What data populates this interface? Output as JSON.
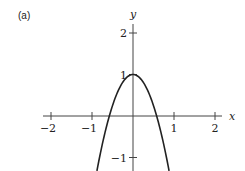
{
  "chart_data": {
    "type": "line",
    "title": "",
    "panel_label": "(a)",
    "xlabel": "x",
    "ylabel": "y",
    "xlim": [
      -2.2,
      2.2
    ],
    "ylim": [
      -1.33,
      2.2
    ],
    "x_ticks": [
      -2,
      -1,
      1,
      2
    ],
    "x_tick_labels": [
      "−2",
      "−1",
      "1",
      "2"
    ],
    "y_ticks": [
      2,
      1,
      -1
    ],
    "y_tick_labels": [
      "2",
      "1",
      "−1"
    ],
    "grid": false,
    "legend": null,
    "series": [
      {
        "name": "y = 1 - 3x^2",
        "x": [
          -0.88,
          -0.8,
          -0.6,
          -0.4,
          -0.2,
          0,
          0.2,
          0.4,
          0.6,
          0.8,
          0.88
        ],
        "y": [
          -1.32,
          -0.92,
          -0.08,
          0.52,
          0.88,
          1.0,
          0.88,
          0.52,
          -0.08,
          -0.92,
          -1.32
        ]
      }
    ],
    "annotations": []
  },
  "style": {
    "axis_color": "#444444",
    "curve_color": "#222222",
    "background": "#ffffff"
  }
}
